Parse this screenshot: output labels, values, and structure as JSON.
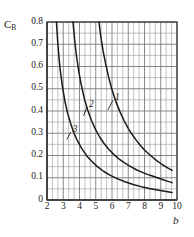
{
  "chart_data": {
    "type": "line",
    "title": "",
    "xlabel": "b",
    "ylabel": "C_B",
    "ylabel_main": "C",
    "ylabel_sub": "B",
    "xlim": [
      2,
      10
    ],
    "ylim": [
      0,
      0.8
    ],
    "grid": true,
    "grid_minor_x": 3,
    "grid_minor_y": 2,
    "legend": "inline-curve-labels",
    "xticks": [
      "2",
      "3",
      "4",
      "5",
      "6",
      "7",
      "8",
      "9",
      "10"
    ],
    "xtick_values": [
      2,
      3,
      4,
      5,
      6,
      7,
      8,
      9,
      10
    ],
    "yticks": [
      "0",
      "0.1",
      "0.2",
      "0.3",
      "0.4",
      "0.5",
      "0.6",
      "0.7",
      "0.8"
    ],
    "ytick_values": [
      0,
      0.1,
      0.2,
      0.3,
      0.4,
      0.5,
      0.6,
      0.7,
      0.8
    ],
    "series": [
      {
        "name": "1",
        "label": "1",
        "label_x": 6.15,
        "label_y": 0.455,
        "leader_to_x": 5.75,
        "leader_to_y": 0.405,
        "points": [
          [
            5.2,
            0.8
          ],
          [
            5.3,
            0.74
          ],
          [
            5.45,
            0.67
          ],
          [
            5.6,
            0.615
          ],
          [
            5.8,
            0.55
          ],
          [
            6.0,
            0.495
          ],
          [
            6.25,
            0.44
          ],
          [
            6.5,
            0.395
          ],
          [
            6.75,
            0.355
          ],
          [
            7.0,
            0.322
          ],
          [
            7.25,
            0.293
          ],
          [
            7.5,
            0.268
          ],
          [
            7.75,
            0.245
          ],
          [
            8.0,
            0.225
          ],
          [
            8.25,
            0.208
          ],
          [
            8.5,
            0.192
          ],
          [
            8.75,
            0.177
          ],
          [
            9.0,
            0.164
          ],
          [
            9.25,
            0.152
          ],
          [
            9.5,
            0.141
          ],
          [
            9.7,
            0.133
          ]
        ]
      },
      {
        "name": "2",
        "label": "2",
        "label_x": 4.55,
        "label_y": 0.425,
        "leader_to_x": 4.25,
        "leader_to_y": 0.378,
        "points": [
          [
            3.6,
            0.8
          ],
          [
            3.7,
            0.72
          ],
          [
            3.8,
            0.655
          ],
          [
            3.95,
            0.58
          ],
          [
            4.1,
            0.52
          ],
          [
            4.3,
            0.455
          ],
          [
            4.5,
            0.405
          ],
          [
            4.75,
            0.355
          ],
          [
            5.0,
            0.315
          ],
          [
            5.25,
            0.282
          ],
          [
            5.5,
            0.255
          ],
          [
            5.8,
            0.228
          ],
          [
            6.1,
            0.205
          ],
          [
            6.4,
            0.186
          ],
          [
            6.75,
            0.168
          ],
          [
            7.1,
            0.152
          ],
          [
            7.5,
            0.136
          ],
          [
            7.9,
            0.123
          ],
          [
            8.3,
            0.112
          ],
          [
            8.7,
            0.102
          ],
          [
            9.1,
            0.092
          ],
          [
            9.4,
            0.085
          ],
          [
            9.7,
            0.078
          ]
        ]
      },
      {
        "name": "3",
        "label": "3",
        "label_x": 3.55,
        "label_y": 0.312,
        "leader_to_x": 3.22,
        "leader_to_y": 0.272,
        "points": [
          [
            2.58,
            0.8
          ],
          [
            2.65,
            0.72
          ],
          [
            2.72,
            0.655
          ],
          [
            2.82,
            0.58
          ],
          [
            2.95,
            0.51
          ],
          [
            3.1,
            0.445
          ],
          [
            3.25,
            0.395
          ],
          [
            3.45,
            0.345
          ],
          [
            3.65,
            0.302
          ],
          [
            3.9,
            0.262
          ],
          [
            4.15,
            0.23
          ],
          [
            4.45,
            0.198
          ],
          [
            4.75,
            0.174
          ],
          [
            5.1,
            0.15
          ],
          [
            5.5,
            0.128
          ],
          [
            5.9,
            0.111
          ],
          [
            6.35,
            0.095
          ],
          [
            6.8,
            0.082
          ],
          [
            7.3,
            0.07
          ],
          [
            7.8,
            0.06
          ],
          [
            8.3,
            0.052
          ],
          [
            8.8,
            0.045
          ],
          [
            9.25,
            0.039
          ],
          [
            9.7,
            0.034
          ]
        ]
      }
    ]
  },
  "plot_frame": {
    "left_px": 47,
    "right_px": 177,
    "top_px": 22,
    "bottom_px": 200
  },
  "colors": {
    "curve": "#1a1a1a",
    "grid_major": "#7a7a7a",
    "grid_minor": "#9a9a9a",
    "frame": "#3a3a3a",
    "text": "#1a1a1a",
    "background": "#ffffff"
  }
}
